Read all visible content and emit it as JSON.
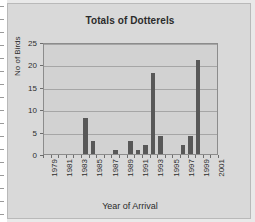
{
  "figure": {
    "background_color": "#e9e9e9",
    "card_color": "#d9d9d9",
    "plot_color": "#d2d2d2"
  },
  "chart_data": {
    "type": "bar",
    "title": "Totals of Dotterels",
    "xlabel": "Year of Arrival",
    "ylabel": "No of Birds",
    "categories": [
      "1979",
      "1980",
      "1981",
      "1982",
      "1983",
      "1984",
      "1985",
      "1986",
      "1987",
      "1988",
      "1989",
      "1990",
      "1991",
      "1992",
      "1993",
      "1994",
      "1995",
      "1996",
      "1997",
      "1998",
      "1999",
      "2000",
      "2001"
    ],
    "values": [
      0,
      0,
      0,
      0,
      0,
      8,
      3,
      0,
      0,
      1,
      0,
      3,
      1,
      2,
      18,
      4,
      0,
      0,
      2,
      4,
      21,
      0,
      0
    ],
    "tick_labels_x": [
      "1979",
      "1981",
      "1983",
      "1985",
      "1987",
      "1989",
      "1991",
      "1993",
      "1995",
      "1997",
      "1999",
      "2001"
    ],
    "tick_labels_y": [
      "0",
      "5",
      "10",
      "15",
      "20",
      "25"
    ],
    "ylim": [
      0,
      25
    ],
    "ytick_interval": 5,
    "grid": true,
    "grid_axis": "y",
    "legend": false,
    "bar_color": "#585858",
    "grid_color": "#a6a6a6"
  }
}
